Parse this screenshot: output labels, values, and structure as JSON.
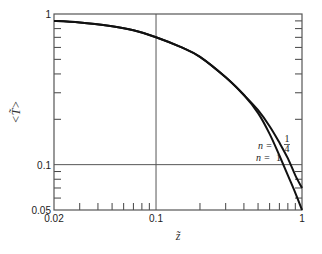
{
  "chart_data": {
    "type": "line",
    "title": "",
    "xlabel": "z̃",
    "ylabel": "<T̃>",
    "xscale": "log",
    "yscale": "log",
    "xlim": [
      0.02,
      1
    ],
    "ylim": [
      0.05,
      1
    ],
    "x_tick_labels": [
      "0.02",
      "0.1",
      "1"
    ],
    "x_ticks": [
      0.02,
      0.1,
      1
    ],
    "x_minor_ticks": [
      0.03,
      0.04,
      0.05,
      0.06,
      0.07,
      0.08,
      0.09,
      0.2,
      0.3,
      0.4,
      0.5,
      0.6,
      0.7,
      0.8,
      0.9
    ],
    "y_tick_labels": [
      "0.05",
      "0.1",
      "1"
    ],
    "y_ticks": [
      0.05,
      0.1,
      1
    ],
    "y_minor_ticks": [
      0.06,
      0.07,
      0.08,
      0.09,
      0.2,
      0.3,
      0.4,
      0.5,
      0.6,
      0.7,
      0.8,
      0.9
    ],
    "reference_lines": {
      "x": [
        0.1
      ],
      "y": [
        0.1
      ]
    },
    "grid": false,
    "series": [
      {
        "name": "n = 1/4",
        "label_prefix": "n = ",
        "label_num": "1",
        "label_den": "4",
        "x": [
          0.02,
          0.03,
          0.05,
          0.07,
          0.1,
          0.15,
          0.2,
          0.3,
          0.4,
          0.5,
          0.6,
          0.7,
          0.8,
          0.9,
          1.0
        ],
        "y": [
          0.9,
          0.88,
          0.83,
          0.78,
          0.7,
          0.6,
          0.52,
          0.38,
          0.29,
          0.23,
          0.18,
          0.14,
          0.11,
          0.085,
          0.07
        ]
      },
      {
        "name": "n = 1",
        "label_prefix": "n = ",
        "label_num": "1",
        "label_den": "",
        "x": [
          0.02,
          0.03,
          0.05,
          0.07,
          0.1,
          0.15,
          0.2,
          0.3,
          0.4,
          0.5,
          0.6,
          0.7,
          0.8,
          0.9,
          1.0
        ],
        "y": [
          0.9,
          0.88,
          0.83,
          0.78,
          0.7,
          0.6,
          0.52,
          0.38,
          0.29,
          0.22,
          0.16,
          0.115,
          0.085,
          0.065,
          0.05
        ]
      }
    ]
  }
}
